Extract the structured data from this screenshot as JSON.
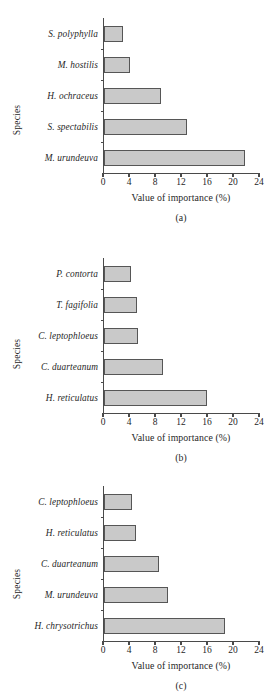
{
  "figure": {
    "axis_titles": {
      "y": "Species",
      "x": "Value of importance (%)"
    },
    "bar_color": "#c9c9c9",
    "bar_border_color": "#565656",
    "axis_color": "#4a4a4a"
  },
  "chart_data": [
    {
      "type": "bar",
      "orientation": "horizontal",
      "panel": "(a)",
      "title": "",
      "categories": [
        "S. polyphylla",
        "M. hostilis",
        "H. ochraceus",
        "S. spectabilis",
        "M. urundeuva"
      ],
      "values": [
        3.0,
        4.1,
        8.8,
        12.8,
        21.8
      ],
      "xlabel": "Value of importance (%)",
      "ylabel": "Species",
      "xlim": [
        0,
        24
      ],
      "xticks": [
        0,
        4,
        8,
        12,
        16,
        20,
        24
      ],
      "grid": false,
      "legend": "none"
    },
    {
      "type": "bar",
      "orientation": "horizontal",
      "panel": "(b)",
      "title": "",
      "categories": [
        "P. contorta",
        "T. fagifolia",
        "C. leptophloeus",
        "C. duarteanum",
        "H. reticulatus"
      ],
      "values": [
        4.2,
        5.1,
        5.3,
        9.2,
        16.0
      ],
      "xlabel": "Value of importance (%)",
      "ylabel": "Species",
      "xlim": [
        0,
        24
      ],
      "xticks": [
        0,
        4,
        8,
        12,
        16,
        20,
        24
      ],
      "grid": false,
      "legend": "none"
    },
    {
      "type": "bar",
      "orientation": "horizontal",
      "panel": "(c)",
      "title": "",
      "categories": [
        "C. leptophloeus",
        "H. reticulatus",
        "C. duarteanum",
        "M. urundeuva",
        "H. chrysotrichus"
      ],
      "values": [
        4.3,
        5.0,
        8.5,
        9.9,
        18.8
      ],
      "xlabel": "Value of importance (%)",
      "ylabel": "Species",
      "xlim": [
        0,
        24
      ],
      "xticks": [
        0,
        4,
        8,
        12,
        16,
        20,
        24
      ],
      "grid": false,
      "legend": "none"
    }
  ]
}
